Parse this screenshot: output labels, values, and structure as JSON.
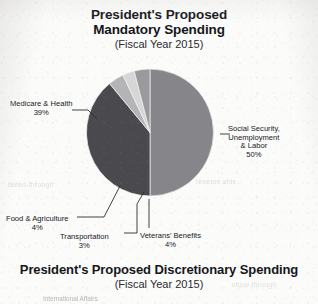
{
  "page": {
    "kind": "scanned-textbook-page",
    "ink_color": "#16181c",
    "paper_color": "#fbfbfa"
  },
  "mandatory": {
    "title_line1": "President's Proposed",
    "title_line2": "Mandatory Spending",
    "subtitle": "(Fiscal Year 2015)"
  },
  "discretionary": {
    "title": "President's Proposed Discretionary Spending",
    "subtitle": "(Fiscal Year 2015)",
    "cut_off_label": "International Affairs"
  },
  "ghosts": [
    {
      "text": "bleed-through",
      "left": 8,
      "top": 181
    },
    {
      "text": "reverse side",
      "left": 196,
      "top": 178
    },
    {
      "text": "show through",
      "left": 232,
      "top": 281
    }
  ],
  "chart_data": {
    "type": "pie",
    "title": "President's Proposed Mandatory Spending",
    "subtitle": "(Fiscal Year 2015)",
    "units": "percent of mandatory spending",
    "start_angle_deg": 0,
    "direction": "clockwise",
    "legend": "none (direct labels with leader lines)",
    "total": 100,
    "slices": [
      {
        "label": "Social Security, Unemployment & Labor",
        "label_lines": [
          "Social Security,",
          "Unemployment",
          "& Labor"
        ],
        "value": 50,
        "display_value": "50%",
        "color": "#86868a"
      },
      {
        "label": "Medicare & Health",
        "label_lines": [
          "Medicare & Health"
        ],
        "value": 39,
        "display_value": "39%",
        "color": "#4a4a4e"
      },
      {
        "label": "Veterans' Benefits",
        "label_lines": [
          "Veterans' Benefits"
        ],
        "value": 4,
        "display_value": "4%",
        "color": "#b4b4b6"
      },
      {
        "label": "Transportation",
        "label_lines": [
          "Transportation"
        ],
        "value": 3,
        "display_value": "3%",
        "color": "#d6d6d7"
      },
      {
        "label": "Food & Agriculture",
        "label_lines": [
          "Food & Agriculture"
        ],
        "value": 4,
        "display_value": "4%",
        "color": "#9a9a9d"
      }
    ]
  }
}
